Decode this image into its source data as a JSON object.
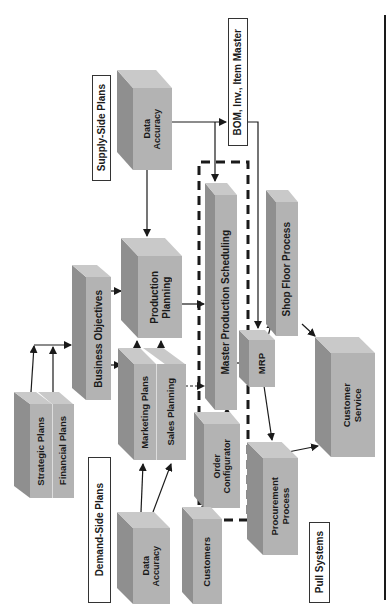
{
  "diagram": {
    "labels": {
      "supply_side": "Supply-Side Plans",
      "demand_side": "Demand-Side Plans",
      "bom": "BOM, Inv., Item Master",
      "pull_systems": "Pull Systems"
    },
    "blocks": {
      "data_accuracy_supply": "Data\nAccuracy",
      "production_planning": "Production\nPlanning",
      "business_objectives": "Business Objectives",
      "mps": "Master Production Scheduling",
      "shop_floor": "Shop Floor Process",
      "strategic_plans": "Strategic Plans",
      "financial_plans": "Financial Plans",
      "marketing_plans": "Marketing Plans",
      "sales_planning": "Sales Planning",
      "data_accuracy_demand": "Data\nAccuracy",
      "order_configurator": "Order\nConfigurator",
      "customers": "Customers",
      "mrp": "MRP",
      "procurement": "Procurement\nProcess",
      "customer_service": "Customer\nService"
    },
    "colors": {
      "front": "#b3b3b3",
      "side": "#8f8f8f",
      "top": "#c9c9c9",
      "line": "#1a1a1a"
    }
  }
}
